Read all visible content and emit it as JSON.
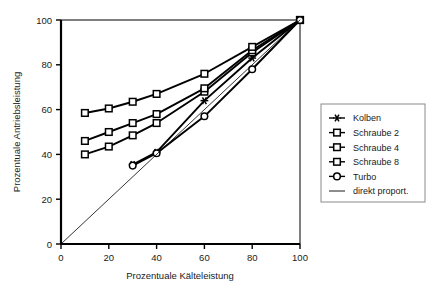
{
  "chart_data": {
    "type": "line",
    "title": "",
    "xlabel": "Prozentuale Kälteleistung",
    "ylabel": "Prozentuale Antriebsleistung",
    "xlim": [
      0,
      100
    ],
    "ylim": [
      0,
      100
    ],
    "xticks": [
      0,
      20,
      40,
      60,
      80,
      100
    ],
    "yticks": [
      0,
      20,
      40,
      60,
      80,
      100
    ],
    "grid": false,
    "legend_position": "right",
    "series": [
      {
        "name": "Kolben",
        "marker": "star",
        "x": [
          30,
          40,
          60,
          80,
          100
        ],
        "values": [
          35.5,
          41.0,
          64.0,
          83.0,
          100.0
        ]
      },
      {
        "name": "Schraube 2",
        "marker": "square",
        "x": [
          10,
          20,
          30,
          40,
          60,
          80,
          100
        ],
        "values": [
          40.0,
          43.5,
          48.5,
          54.0,
          68.0,
          85.5,
          100.0
        ]
      },
      {
        "name": "Schraube 4",
        "marker": "square",
        "x": [
          10,
          20,
          30,
          40,
          60,
          80,
          100
        ],
        "values": [
          46.0,
          50.0,
          54.0,
          58.0,
          69.5,
          86.5,
          100.0
        ]
      },
      {
        "name": "Schraube 8",
        "marker": "square",
        "x": [
          10,
          20,
          30,
          40,
          60,
          80,
          100
        ],
        "values": [
          58.5,
          60.5,
          63.5,
          67.0,
          76.0,
          88.0,
          100.0
        ]
      },
      {
        "name": "Turbo",
        "marker": "circle",
        "x": [
          30,
          40,
          60,
          80,
          100
        ],
        "values": [
          35.0,
          40.5,
          57.0,
          78.0,
          100.0
        ]
      },
      {
        "name": "direkt proport.",
        "marker": "none",
        "x": [
          0,
          100
        ],
        "values": [
          0,
          100
        ]
      }
    ],
    "colors": {
      "line": "#000000",
      "axis": "#000000",
      "text": "#1a1a1a",
      "legend_border": "#8a8a8a",
      "background": "#ffffff"
    }
  },
  "axes": {
    "x_tick_labels": [
      "0",
      "20",
      "40",
      "60",
      "80",
      "100"
    ],
    "y_tick_labels": [
      "0",
      "20",
      "40",
      "60",
      "80",
      "100"
    ],
    "x_axis_title": "Prozentuale Kälteleistung",
    "y_axis_title": "Prozentuale Antriebsleistung"
  },
  "legend": {
    "items": [
      {
        "label": "Kolben",
        "marker": "star"
      },
      {
        "label": "Schraube 2",
        "marker": "square"
      },
      {
        "label": "Schraube 4",
        "marker": "square"
      },
      {
        "label": "Schraube 8",
        "marker": "square"
      },
      {
        "label": "Turbo",
        "marker": "circle"
      },
      {
        "label": "direkt proport.",
        "marker": "none"
      }
    ]
  }
}
